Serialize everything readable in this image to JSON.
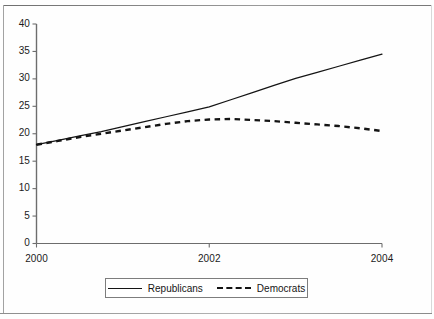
{
  "chart_data": {
    "type": "line",
    "title": "",
    "xlabel": "",
    "ylabel": "",
    "xlim": [
      2000,
      2004
    ],
    "ylim": [
      0,
      40
    ],
    "grid": false,
    "legend_position": "bottom-center",
    "x_ticks": [
      "2000",
      "2002",
      "2004"
    ],
    "x_tick_values": [
      2000,
      2002,
      2004
    ],
    "y_ticks": [
      "0",
      "5",
      "10",
      "15",
      "20",
      "25",
      "30",
      "35",
      "40"
    ],
    "y_tick_values": [
      0,
      5,
      10,
      15,
      20,
      25,
      30,
      35,
      40
    ],
    "x": [
      2000,
      2000.25,
      2000.5,
      2000.75,
      2001,
      2001.25,
      2001.5,
      2001.75,
      2002,
      2002.25,
      2002.5,
      2002.75,
      2003,
      2003.25,
      2003.5,
      2003.75,
      2004
    ],
    "series": [
      {
        "name": "Republicans",
        "style": "solid",
        "color": "#141414",
        "values": [
          18.0,
          18.8,
          19.6,
          20.4,
          21.3,
          22.2,
          23.1,
          24.0,
          24.9,
          26.2,
          27.5,
          28.8,
          30.1,
          31.2,
          32.3,
          33.4,
          34.5
        ]
      },
      {
        "name": "Democrats",
        "style": "dashed",
        "color": "#141414",
        "values": [
          18.0,
          18.7,
          19.4,
          20.0,
          20.6,
          21.2,
          21.8,
          22.3,
          22.6,
          22.7,
          22.5,
          22.3,
          22.0,
          21.7,
          21.4,
          21.0,
          20.5
        ]
      }
    ]
  },
  "legend": {
    "items": [
      {
        "label": "Republicans",
        "style": "solid"
      },
      {
        "label": "Democrats",
        "style": "dashed"
      }
    ]
  },
  "axis_labels": {
    "y": [
      "40",
      "35",
      "30",
      "25",
      "20",
      "15",
      "10",
      "5",
      "0"
    ],
    "x": [
      "2000",
      "2002",
      "2004"
    ]
  }
}
